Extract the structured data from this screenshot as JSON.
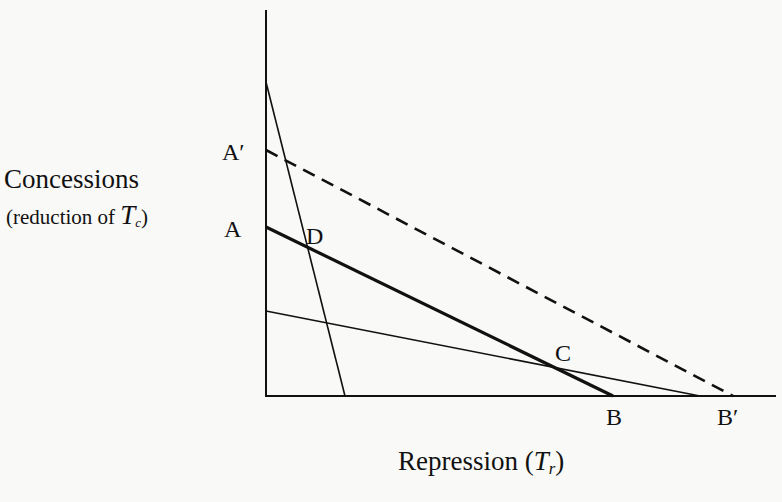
{
  "diagram": {
    "y_axis_label": "Concessions",
    "y_axis_sublabel_prefix": "(reduction of ",
    "y_axis_sublabel_var": "T",
    "y_axis_sublabel_sub": "c",
    "y_axis_sublabel_suffix": ")",
    "x_axis_label_prefix": "Repression (",
    "x_axis_label_var": "T",
    "x_axis_label_sub": "r",
    "x_axis_label_suffix": ")",
    "points": {
      "A_prime": "A′",
      "A": "A",
      "B": "B",
      "B_prime": "B′",
      "C": "C",
      "D": "D"
    },
    "lines": [
      {
        "name": "steep-line",
        "from": [
          266,
          82
        ],
        "to": [
          345,
          396
        ],
        "style": "thin"
      },
      {
        "name": "dashed-line-A-prime-B-prime",
        "from": [
          266,
          150
        ],
        "to": [
          733,
          396
        ],
        "style": "dashed"
      },
      {
        "name": "thick-line-A-B",
        "from": [
          266,
          227
        ],
        "to": [
          613,
          396
        ],
        "style": "thick"
      },
      {
        "name": "shallow-line",
        "from": [
          266,
          311
        ],
        "to": [
          700,
          396
        ],
        "style": "thin"
      }
    ],
    "colors": {
      "ink": "#111111",
      "background": "#f9f9f7"
    }
  }
}
